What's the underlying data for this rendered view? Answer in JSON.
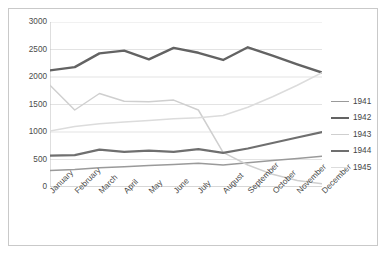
{
  "chart_data": {
    "type": "line",
    "title": "",
    "xlabel": "",
    "ylabel": "",
    "categories": [
      "January",
      "February",
      "March",
      "April",
      "May",
      "June",
      "July",
      "August",
      "September",
      "October",
      "November",
      "December"
    ],
    "ylim": [
      0,
      3000
    ],
    "yticks": [
      0,
      500,
      1000,
      1500,
      2000,
      2500,
      3000
    ],
    "grid": true,
    "legend_position": "right",
    "series": [
      {
        "name": "1941",
        "color": "#9a9a9a",
        "width": 1.5,
        "values": [
          300,
          320,
          350,
          370,
          390,
          410,
          430,
          400,
          440,
          480,
          520,
          560
        ]
      },
      {
        "name": "1942",
        "color": "#636363",
        "width": 2.4,
        "values": [
          2120,
          2180,
          2430,
          2480,
          2320,
          2530,
          2440,
          2310,
          2540,
          2390,
          2230,
          2080
        ]
      },
      {
        "name": "1943",
        "color": "#cfcfcf",
        "width": 1.5,
        "values": [
          1850,
          1400,
          1700,
          1560,
          1550,
          1580,
          1400,
          630,
          400,
          230,
          120,
          60
        ]
      },
      {
        "name": "1944",
        "color": "#6f6f6f",
        "width": 2.2,
        "values": [
          570,
          580,
          680,
          640,
          660,
          640,
          690,
          620,
          700,
          800,
          900,
          1000
        ]
      },
      {
        "name": "1945",
        "color": "#dcdcdc",
        "width": 1.5,
        "values": [
          1020,
          1100,
          1150,
          1180,
          1210,
          1240,
          1260,
          1300,
          1450,
          1640,
          1850,
          2080
        ]
      }
    ]
  },
  "legend": {
    "entries": [
      {
        "label": "1941"
      },
      {
        "label": "1942"
      },
      {
        "label": "1943"
      },
      {
        "label": "1944"
      },
      {
        "label": "1945"
      }
    ]
  },
  "axes": {
    "y_ticks": [
      "3000",
      "2500",
      "2000",
      "1500",
      "1000",
      "500",
      "0"
    ],
    "x_ticks": [
      "January",
      "February",
      "March",
      "April",
      "May",
      "June",
      "July",
      "August",
      "September",
      "October",
      "November",
      "December"
    ]
  },
  "colors": {
    "frame_border": "#c9c9c9",
    "gridline": "#e3e3e3",
    "axis_line": "#bdbdbd",
    "tick_text": "#4b4b4b"
  }
}
